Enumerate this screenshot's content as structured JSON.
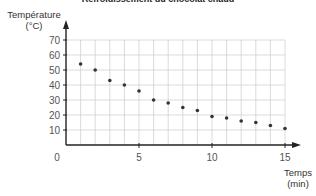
{
  "chart_data": {
    "type": "scatter",
    "title": "Refroidissement du chocolat chaud",
    "xlabel": "Temps (min)",
    "ylabel": "Température (°C)",
    "xlim": [
      0,
      15
    ],
    "ylim": [
      0,
      70
    ],
    "grid": true,
    "x_ticks": [
      0,
      5,
      10,
      15
    ],
    "y_ticks": [
      10,
      20,
      30,
      40,
      50,
      60,
      70
    ],
    "series": [
      {
        "name": "Température",
        "x": [
          1,
          2,
          3,
          4,
          5,
          6,
          7,
          8,
          9,
          10,
          11,
          12,
          13,
          14,
          15
        ],
        "y": [
          54,
          50,
          43,
          40,
          36,
          30,
          28,
          25,
          23,
          19,
          18,
          16,
          15,
          13,
          11
        ]
      }
    ],
    "colors": {
      "points": "#333333",
      "grid": "#cccccc",
      "axis": "#222222"
    }
  },
  "labels": {
    "title": "Refroidissement du chocolat chaud",
    "y_line1": "Température",
    "y_line2": "(°C)",
    "x_line1": "Temps",
    "x_line2": "(min)",
    "origin": "0"
  }
}
